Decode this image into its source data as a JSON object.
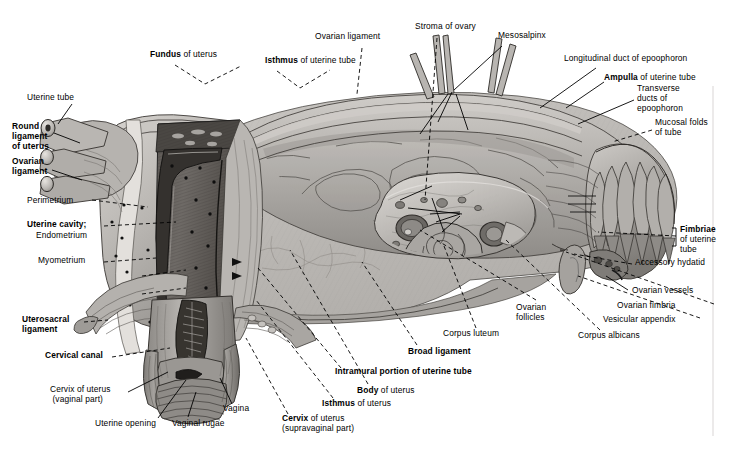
{
  "figure": {
    "type": "anatomical-illustration",
    "style": "grayscale pencil/wash medical drawing",
    "background_color": "#ffffff",
    "ink_color": "#000000"
  },
  "labels": [
    {
      "id": "uterine-tube",
      "text": "Uterine tube",
      "bold_part": "",
      "x": 27,
      "y": 96,
      "align": "left",
      "weight": "normal"
    },
    {
      "id": "round-ligament",
      "text": "Round\nligament\nof uterus",
      "bold_part": "all",
      "x": 12,
      "y": 125,
      "align": "left",
      "weight": "bold"
    },
    {
      "id": "ovarian-ligament-l",
      "text": "Ovarian\nligament",
      "bold_part": "all",
      "x": 12,
      "y": 160,
      "align": "left",
      "weight": "bold"
    },
    {
      "id": "perimetrium",
      "text": "Perimetrium",
      "bold_part": "",
      "x": 27,
      "y": 200,
      "align": "left",
      "weight": "normal"
    },
    {
      "id": "uterine-cavity",
      "text": "Uterine cavity;",
      "bold_part": "all",
      "x": 27,
      "y": 225,
      "align": "left",
      "weight": "bold"
    },
    {
      "id": "endometrium",
      "text": "Endometrium",
      "bold_part": "",
      "x": 36,
      "y": 235,
      "align": "left",
      "weight": "normal"
    },
    {
      "id": "myometrium",
      "text": "Myometrium",
      "bold_part": "",
      "x": 38,
      "y": 260,
      "align": "left",
      "weight": "normal"
    },
    {
      "id": "uterosacral-ligament",
      "text": "Uterosacral\nligament",
      "bold_part": "all",
      "x": 22,
      "y": 318,
      "align": "left",
      "weight": "bold"
    },
    {
      "id": "cervical-canal",
      "text": "Cervical canal",
      "bold_part": "all",
      "x": 45,
      "y": 355,
      "align": "left",
      "weight": "bold"
    },
    {
      "id": "cervix-vaginal",
      "text": "Cervix of uterus\n(vaginal part)",
      "bold_part": "",
      "x": 50,
      "y": 390,
      "align": "left",
      "weight": "normal"
    },
    {
      "id": "uterine-opening",
      "text": "Uterine opening",
      "bold_part": "",
      "x": 95,
      "y": 422,
      "align": "left",
      "weight": "normal"
    },
    {
      "id": "vaginal-rugae",
      "text": "Vaginal rugae",
      "bold_part": "",
      "x": 172,
      "y": 422,
      "align": "left",
      "weight": "normal"
    },
    {
      "id": "vagina",
      "text": "Vagina",
      "bold_part": "",
      "x": 223,
      "y": 408,
      "align": "left",
      "weight": "normal"
    },
    {
      "id": "cervix-supravaginal",
      "text": "Cervix of uterus\n(supravaginal part)",
      "bold_part": "Cervix",
      "x": 282,
      "y": 418,
      "align": "left",
      "weight": "normal"
    },
    {
      "id": "isthmus-uterus",
      "text": "Isthmus of uterus",
      "bold_part": "Isthmus",
      "x": 322,
      "y": 403,
      "align": "left",
      "weight": "normal"
    },
    {
      "id": "body-uterus",
      "text": "Body of uterus",
      "bold_part": "Body",
      "x": 357,
      "y": 390,
      "align": "left",
      "weight": "normal"
    },
    {
      "id": "intramural-portion",
      "text": "Intramural portion of uterine tube",
      "bold_part": "all",
      "x": 335,
      "y": 371,
      "align": "left",
      "weight": "bold"
    },
    {
      "id": "broad-ligament",
      "text": "Broad ligament",
      "bold_part": "all",
      "x": 408,
      "y": 351,
      "align": "left",
      "weight": "bold"
    },
    {
      "id": "corpus-luteum",
      "text": "Corpus luteum",
      "bold_part": "",
      "x": 443,
      "y": 333,
      "align": "left",
      "weight": "normal"
    },
    {
      "id": "ovarian-follicles",
      "text": "Ovarian\nfollicles",
      "bold_part": "",
      "x": 516,
      "y": 307,
      "align": "left",
      "weight": "normal"
    },
    {
      "id": "corpus-albicans",
      "text": "Corpus albicans",
      "bold_part": "",
      "x": 578,
      "y": 335,
      "align": "left",
      "weight": "normal"
    },
    {
      "id": "vesicular-appendix",
      "text": "Vesicular appendix",
      "bold_part": "",
      "x": 603,
      "y": 319,
      "align": "left",
      "weight": "normal"
    },
    {
      "id": "ovarian-fimbria",
      "text": "Ovarian fimbria",
      "bold_part": "",
      "x": 617,
      "y": 305,
      "align": "left",
      "weight": "normal"
    },
    {
      "id": "ovarian-vessels",
      "text": "Ovarian vessels",
      "bold_part": "",
      "x": 632,
      "y": 290,
      "align": "left",
      "weight": "normal"
    },
    {
      "id": "accessory-hydatid",
      "text": "Accessory hydatid",
      "bold_part": "",
      "x": 635,
      "y": 262,
      "align": "left",
      "weight": "normal"
    },
    {
      "id": "fimbriae",
      "text": "Fimbriae",
      "bold_part": "all",
      "x": 680,
      "y": 229,
      "align": "left",
      "weight": "bold"
    },
    {
      "id": "fimbriae-sub",
      "text": "of uterine\ntube",
      "bold_part": "",
      "x": 680,
      "y": 239,
      "align": "left",
      "weight": "normal"
    },
    {
      "id": "mucosal-folds",
      "text": "Mucosal folds\nof tube",
      "bold_part": "",
      "x": 655,
      "y": 122,
      "align": "left",
      "weight": "normal"
    },
    {
      "id": "transverse-ducts",
      "text": "Transverse\nducts of\nepoophoron",
      "bold_part": "",
      "x": 637,
      "y": 88,
      "align": "left",
      "weight": "normal"
    },
    {
      "id": "ampulla",
      "text": "Ampulla of uterine tube",
      "bold_part": "Ampulla",
      "x": 604,
      "y": 77,
      "align": "left",
      "weight": "normal"
    },
    {
      "id": "longitudinal-duct",
      "text": "Longitudinal duct of epoophoron",
      "bold_part": "",
      "x": 564,
      "y": 58,
      "align": "left",
      "weight": "normal"
    },
    {
      "id": "mesosalpinx",
      "text": "Mesosalpinx",
      "bold_part": "",
      "x": 498,
      "y": 35,
      "align": "left",
      "weight": "normal"
    },
    {
      "id": "stroma-of-ovary",
      "text": "Stroma of ovary",
      "bold_part": "",
      "x": 415,
      "y": 26,
      "align": "left",
      "weight": "normal"
    },
    {
      "id": "ovarian-ligament-t",
      "text": "Ovarian ligament",
      "bold_part": "",
      "x": 315,
      "y": 36,
      "align": "left",
      "weight": "normal"
    },
    {
      "id": "isthmus-tube",
      "text": "Isthmus of uterine tube",
      "bold_part": "Isthmus",
      "x": 265,
      "y": 60,
      "align": "left",
      "weight": "normal"
    },
    {
      "id": "fundus-uterus",
      "text": "Fundus of uterus",
      "bold_part": "Fundus",
      "x": 150,
      "y": 54,
      "align": "left",
      "weight": "normal"
    }
  ],
  "structures": [
    {
      "name": "uterine-tube-left-stump",
      "description": "cut stump of uterine tube, upper left"
    },
    {
      "name": "round-ligament-stump",
      "description": "cut stump of round ligament of uterus"
    },
    {
      "name": "ovarian-ligament-stump",
      "description": "cut stump of ovarian ligament"
    },
    {
      "name": "uterus-body-section",
      "description": "sagittally sectioned uterine wall showing cavity, endometrium, myometrium"
    },
    {
      "name": "cervix-and-vagina",
      "description": "cervix with cervical canal and opened vaginal wall with rugae"
    },
    {
      "name": "broad-ligament-sheet",
      "description": "large translucent sheet of broad ligament / mesosalpinx"
    },
    {
      "name": "ovary-sectioned",
      "description": "sectioned ovary showing stroma, follicles, corpus luteum, corpus albicans"
    },
    {
      "name": "uterine-tube-ampulla",
      "description": "ampulla of uterine tube with mucosal folds"
    },
    {
      "name": "fimbriae-fringe",
      "description": "fringe of fimbriae at the infundibulum"
    },
    {
      "name": "epoophoron-ducts",
      "description": "longitudinal and transverse ducts of epoophoron within mesosalpinx"
    },
    {
      "name": "vesicular-appendix",
      "description": "small pedunculated vesicle near fimbriae"
    },
    {
      "name": "ovarian-vessels",
      "description": "vessels entering at the ovarian hilum"
    }
  ]
}
